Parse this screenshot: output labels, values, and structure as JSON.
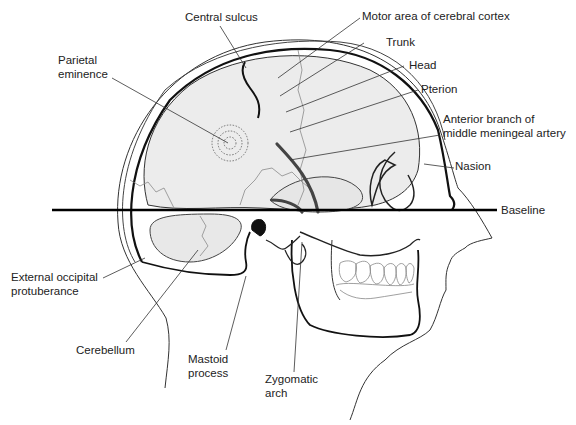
{
  "diagram": {
    "type": "anatomical-illustration",
    "colors": {
      "background": "#ffffff",
      "line": "#1a1a1a",
      "brain_fill": "#ececec",
      "suture": "#8a8a8a",
      "artery": "#3a3a3a"
    },
    "labels": {
      "central_sulcus": "Central sulcus",
      "motor_area": "Motor area of cerebral cortex",
      "trunk": "Trunk",
      "head": "Head",
      "pterion": "Pterion",
      "parietal_eminence_1": "Parietal",
      "parietal_eminence_2": "eminence",
      "anterior_branch_1": "Anterior branch of",
      "anterior_branch_2": "middle meningeal artery",
      "nasion": "Nasion",
      "baseline": "Baseline",
      "external_occipital_1": "External occipital",
      "external_occipital_2": "protuberance",
      "cerebellum": "Cerebellum",
      "mastoid_1": "Mastoid",
      "mastoid_2": "process",
      "zygomatic_1": "Zygomatic",
      "zygomatic_2": "arch"
    }
  }
}
